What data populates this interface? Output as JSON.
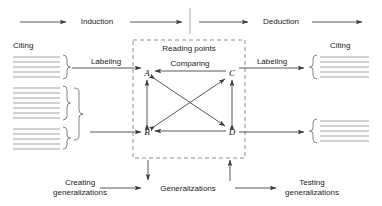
{
  "diagram": {
    "top_flow": {
      "induction_label": "Induction",
      "deduction_label": "Deduction"
    },
    "left_section": {
      "citing_label": "Citing",
      "labeling_label": "Labeling"
    },
    "right_section": {
      "citing_label": "Citing",
      "labeling_label": "Labeling"
    },
    "center_box": {
      "title": "Reading points",
      "comparing_label": "Comparing",
      "nodes": [
        {
          "id": "A",
          "label": "A",
          "x": 147,
          "y": 73
        },
        {
          "id": "C",
          "label": "C",
          "x": 232,
          "y": 73
        },
        {
          "id": "B",
          "label": "B",
          "x": 147,
          "y": 132
        },
        {
          "id": "D",
          "label": "D",
          "x": 232,
          "y": 132
        }
      ],
      "edges": [
        {
          "from": "C",
          "to": "A"
        },
        {
          "from": "D",
          "to": "B"
        },
        {
          "from": "B",
          "to": "A"
        },
        {
          "from": "D",
          "to": "C"
        },
        {
          "from": "A",
          "to": "B"
        },
        {
          "from": "C",
          "to": "D"
        },
        {
          "from": "D",
          "to": "A"
        },
        {
          "from": "B",
          "to": "C"
        },
        {
          "from": "C",
          "to": "B"
        },
        {
          "from": "A",
          "to": "D"
        }
      ]
    },
    "bottom_flow": {
      "creating_label_line1": "Creating",
      "creating_label_line2": "generalizations",
      "generalizations_label": "Generalizations",
      "testing_label_line1": "Testing",
      "testing_label_line2": "generalizations"
    },
    "colors": {
      "stroke": "#3a3a3a",
      "text": "#1a1a1a",
      "dashed": "#6e6e6e",
      "doc_line": "#8a8a8a"
    }
  }
}
